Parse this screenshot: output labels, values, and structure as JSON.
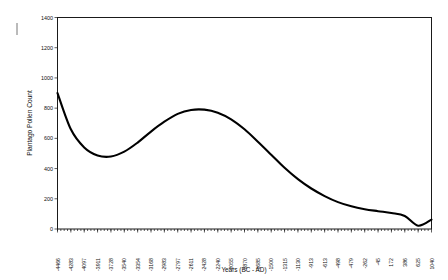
{
  "chart_data": {
    "type": "line",
    "title": "",
    "xlabel": "Years (BC - AD)",
    "ylabel": "Plantago Pollen Count",
    "ylim": [
      0,
      1400
    ],
    "yticks": [
      0,
      200,
      400,
      600,
      800,
      1000,
      1200,
      1400
    ],
    "grid": false,
    "legend": null,
    "categories": [
      "-4466",
      "-4283",
      "-4097",
      "-3911",
      "-3728",
      "-3540",
      "-3354",
      "-3168",
      "-2983",
      "-2797",
      "-2611",
      "-2428",
      "-2240",
      "-2055",
      "-1870",
      "-1685",
      "-1500",
      "-1315",
      "-1130",
      "-913",
      "-613",
      "-498",
      "-479",
      "-262",
      "-45",
      "172",
      "386",
      "625",
      "1040"
    ],
    "values": [
      900,
      660,
      540,
      487,
      480,
      512,
      572,
      645,
      710,
      762,
      788,
      790,
      770,
      726,
      660,
      578,
      492,
      405,
      330,
      268,
      218,
      178,
      150,
      131,
      118,
      106,
      86,
      22,
      62
    ],
    "series": [
      {
        "name": "Plantago Pollen Count",
        "values": [
          900,
          660,
          540,
          487,
          480,
          512,
          572,
          645,
          710,
          762,
          788,
          790,
          770,
          726,
          660,
          578,
          492,
          405,
          330,
          268,
          218,
          178,
          150,
          131,
          118,
          106,
          86,
          22,
          62
        ]
      }
    ],
    "line_color": "#000000"
  }
}
